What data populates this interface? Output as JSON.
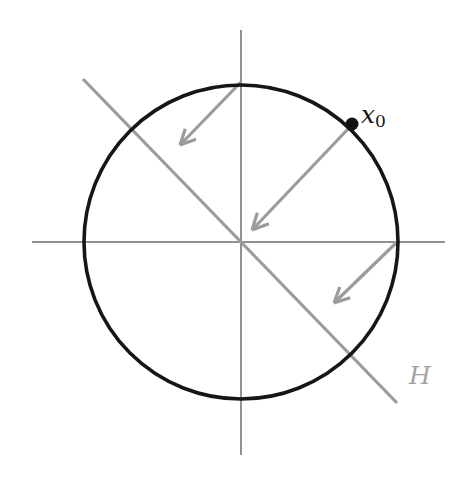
{
  "figure": {
    "background_color": "#ffffff",
    "colors": {
      "circle": "#161616",
      "axis": "#6d6d6d",
      "accent_gray": "#9b9b9b",
      "label_gray": "#a3a3a3",
      "point": "#111111"
    },
    "labels": {
      "point_label_base": "x",
      "point_label_sub": "0",
      "hyperplane_label": "H"
    }
  },
  "chart_data": {
    "type": "scatter",
    "title": "",
    "xlabel": "",
    "ylabel": "",
    "grid": false,
    "legend": "none",
    "xlim": [
      -1.35,
      1.43
    ],
    "ylim": [
      -1.36,
      1.35
    ],
    "geometry": {
      "center": {
        "x": 241,
        "y": 242
      },
      "radius": 157,
      "circle": {
        "name": "unit-circle",
        "cx": 241,
        "cy": 242,
        "r": 157,
        "stroke": "#161616",
        "stroke_width": 3.6,
        "fill": "none"
      },
      "axes": [
        {
          "name": "x-axis",
          "x1": 32,
          "y1": 242,
          "x2": 445,
          "y2": 242,
          "stroke": "#6d6d6d",
          "stroke_width": 1.5
        },
        {
          "name": "y-axis",
          "x1": 241,
          "y1": 30,
          "x2": 241,
          "y2": 455,
          "stroke": "#6d6d6d",
          "stroke_width": 1.5
        }
      ],
      "hyperplane": {
        "name": "hyperplane-H",
        "x1": 83,
        "y1": 79,
        "x2": 397,
        "y2": 403,
        "stroke": "#9b9b9b",
        "stroke_width": 3.2,
        "slope": -1.03,
        "label": "H",
        "label_x": 409,
        "label_y": 363
      },
      "point": {
        "name": "point-x0",
        "x": 352,
        "y": 124,
        "radius": 6.5,
        "fill": "#111111",
        "label": "x0",
        "label_x": 361,
        "label_y": 102,
        "unit_coords": [
          0.707,
          0.751
        ]
      },
      "arrows": [
        {
          "name": "arrow-from-top",
          "x1": 241,
          "y1": 82,
          "x2": 180,
          "y2": 145,
          "stroke": "#9b9b9b",
          "stroke_width": 3.2,
          "head_length": 17,
          "head_angle_deg": 26
        },
        {
          "name": "arrow-from-x0",
          "x1": 348,
          "y1": 129,
          "x2": 252,
          "y2": 230,
          "stroke": "#9b9b9b",
          "stroke_width": 3.2,
          "head_length": 18,
          "head_angle_deg": 26
        },
        {
          "name": "arrow-from-right",
          "x1": 396,
          "y1": 243,
          "x2": 334,
          "y2": 303,
          "stroke": "#9b9b9b",
          "stroke_width": 3.2,
          "head_length": 17,
          "head_angle_deg": 26
        }
      ]
    }
  }
}
